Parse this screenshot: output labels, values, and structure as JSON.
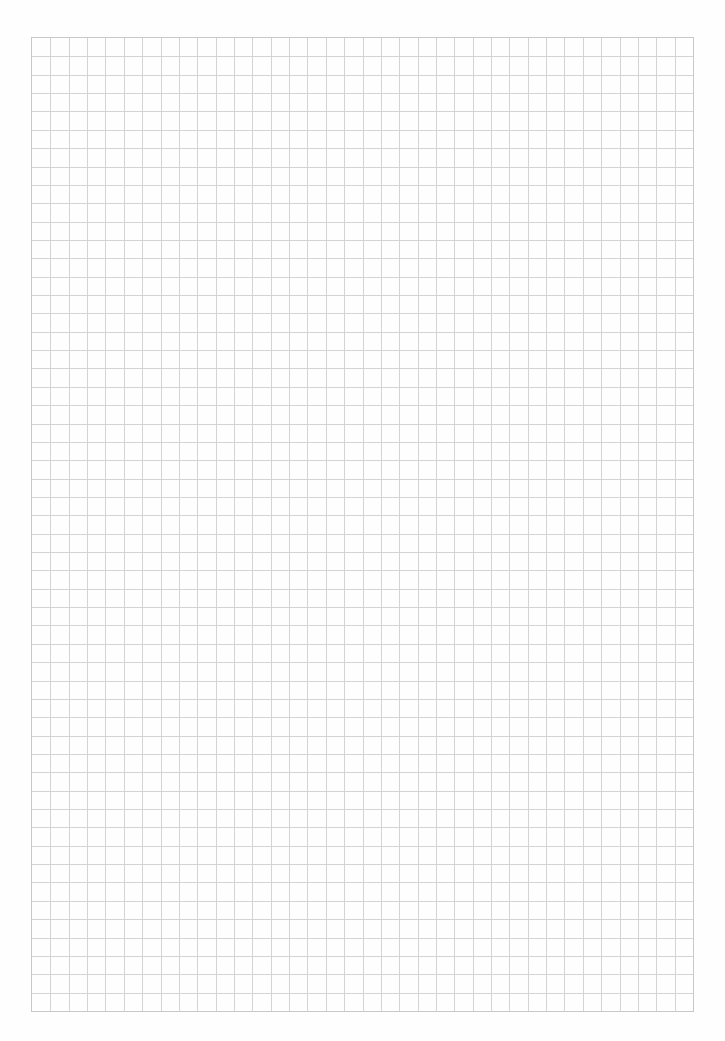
{
  "page": {
    "type": "graph-paper",
    "background_color": "#fefefe",
    "grid": {
      "columns": 36,
      "rows": 53,
      "cell_size_px": 18.4,
      "line_color": "#d4d4d4",
      "border_color": "#c8c8c8"
    }
  }
}
